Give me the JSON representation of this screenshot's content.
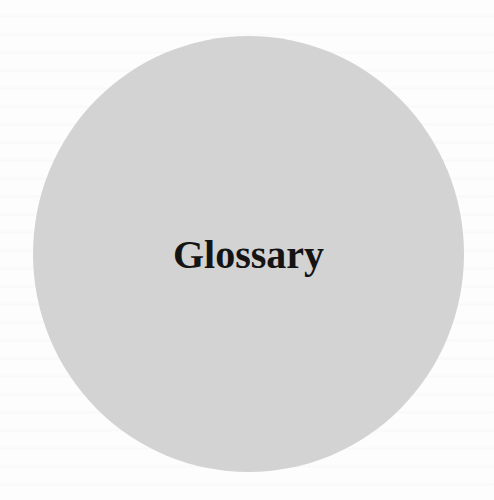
{
  "page": {
    "title": "Glossary",
    "colors": {
      "background": "#fdfdfd",
      "circle": "#d3d3d3",
      "text": "#141414"
    }
  }
}
